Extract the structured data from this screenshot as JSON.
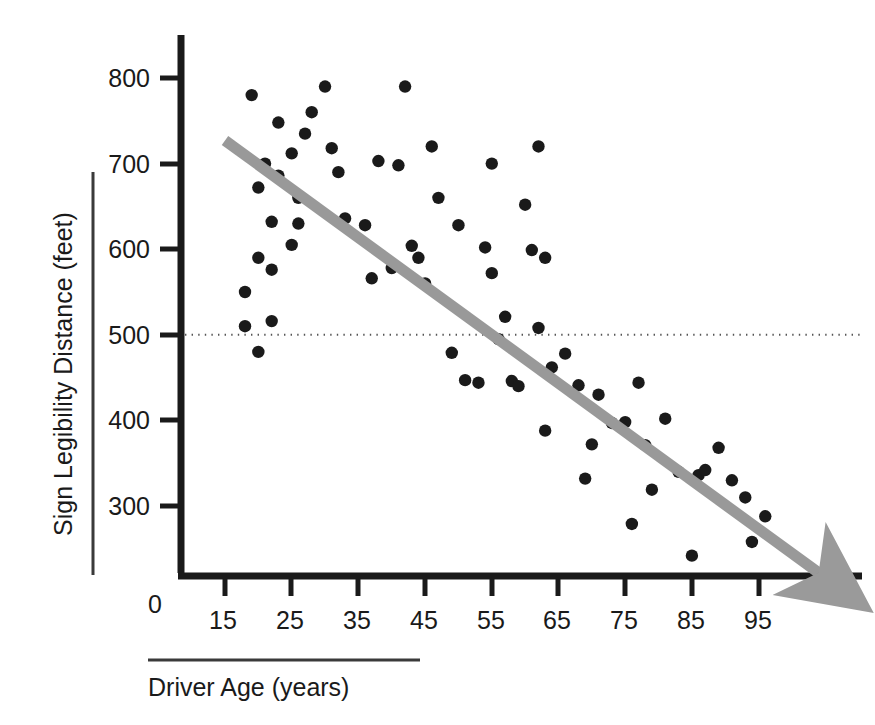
{
  "chart_data": {
    "type": "scatter",
    "title": "",
    "subtitle": "",
    "xlabel": "Driver Age (years)",
    "ylabel": "Sign Legibility Distance (feet)",
    "xlim": [
      10,
      105
    ],
    "ylim": [
      200,
      830
    ],
    "origin_label": "0",
    "grid": false,
    "legend": null,
    "xticks": [
      15,
      25,
      35,
      45,
      55,
      65,
      75,
      85,
      95
    ],
    "xtick_labels": [
      "15",
      "25",
      "35",
      "45",
      "55",
      "65",
      "75",
      "85",
      "95"
    ],
    "yticks": [
      300,
      400,
      500,
      600,
      700,
      800
    ],
    "ytick_labels": [
      "300",
      "400",
      "500",
      "600",
      "700",
      "800"
    ],
    "series": [
      {
        "name": "Sign legibility observations",
        "marker": "filled-circle",
        "color": "#1a1a1a",
        "points": [
          [
            18,
            510
          ],
          [
            20,
            590
          ],
          [
            22,
            516
          ],
          [
            20,
            480
          ],
          [
            18,
            550
          ],
          [
            22,
            576
          ],
          [
            21,
            700
          ],
          [
            23,
            686
          ],
          [
            20,
            672
          ],
          [
            19,
            780
          ],
          [
            22,
            632
          ],
          [
            23,
            748
          ],
          [
            25,
            712
          ],
          [
            26,
            660
          ],
          [
            25,
            605
          ],
          [
            26,
            630
          ],
          [
            28,
            760
          ],
          [
            27,
            735
          ],
          [
            30,
            790
          ],
          [
            31,
            718
          ],
          [
            32,
            690
          ],
          [
            33,
            636
          ],
          [
            36,
            628
          ],
          [
            37,
            566
          ],
          [
            38,
            703
          ],
          [
            40,
            578
          ],
          [
            42,
            790
          ],
          [
            41,
            698
          ],
          [
            43,
            604
          ],
          [
            44,
            590
          ],
          [
            45,
            560
          ],
          [
            46,
            720
          ],
          [
            47,
            660
          ],
          [
            49,
            479
          ],
          [
            50,
            628
          ],
          [
            51,
            447
          ],
          [
            53,
            444
          ],
          [
            54,
            602
          ],
          [
            55,
            572
          ],
          [
            55,
            700
          ],
          [
            56,
            495
          ],
          [
            57,
            521
          ],
          [
            58,
            446
          ],
          [
            59,
            440
          ],
          [
            60,
            652
          ],
          [
            61,
            599
          ],
          [
            62,
            508
          ],
          [
            62,
            720
          ],
          [
            63,
            590
          ],
          [
            63,
            388
          ],
          [
            64,
            462
          ],
          [
            66,
            478
          ],
          [
            68,
            441
          ],
          [
            69,
            332
          ],
          [
            70,
            372
          ],
          [
            71,
            430
          ],
          [
            73,
            397
          ],
          [
            75,
            398
          ],
          [
            76,
            279
          ],
          [
            77,
            444
          ],
          [
            78,
            371
          ],
          [
            79,
            319
          ],
          [
            81,
            402
          ],
          [
            83,
            340
          ],
          [
            85,
            242
          ],
          [
            86,
            336
          ],
          [
            87,
            342
          ],
          [
            89,
            368
          ],
          [
            91,
            330
          ],
          [
            93,
            310
          ],
          [
            94,
            258
          ],
          [
            96,
            288
          ]
        ]
      }
    ],
    "trend_line": {
      "name": "fitted regression trend",
      "color": "#999999",
      "style": "solid-thick-with-arrowhead",
      "start": [
        15,
        727
      ],
      "end": [
        104,
        222
      ],
      "arrowhead": true
    },
    "reference_line": {
      "name": "500 ft reference",
      "value": 500,
      "axis": "y",
      "style": "dotted",
      "color": "#555555"
    },
    "annotations": []
  }
}
